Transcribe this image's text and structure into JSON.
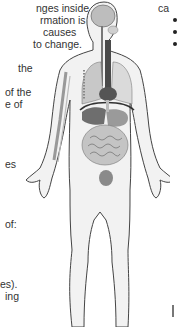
{
  "left_column": {
    "lines": [
      {
        "text": "nges inside",
        "x": 36,
        "y": 2
      },
      {
        "text": "rmation is",
        "x": 40,
        "y": 14
      },
      {
        "text": "causes",
        "x": 43,
        "y": 26
      },
      {
        "text": "to change.",
        "x": 33,
        "y": 38
      },
      {
        "text": "the",
        "x": 18,
        "y": 62
      },
      {
        "text": "of the",
        "x": 5,
        "y": 86
      },
      {
        "text": "e of",
        "x": 5,
        "y": 98
      },
      {
        "text": "es",
        "x": 5,
        "y": 158
      },
      {
        "text": "of:",
        "x": 5,
        "y": 218
      },
      {
        "text": "es).",
        "x": 0,
        "y": 278
      },
      {
        "text": "ing",
        "x": 5,
        "y": 290
      }
    ]
  },
  "right_column": {
    "heading_fragment": "ca",
    "bullets": [
      "",
      "",
      ""
    ]
  },
  "figure": {
    "colors": {
      "outline": "#444444",
      "skin": "#f2f2f2",
      "brain": "#bdbdbd",
      "lungs": "#d6d6d6",
      "heart": "#555555",
      "trachea": "#4a4a4a",
      "liver": "#6e6e6e",
      "stomach": "#9a9a9a",
      "intestine": "#b4b4b4",
      "bladder": "#8a8a8a",
      "diaphragm": "#333333"
    }
  }
}
